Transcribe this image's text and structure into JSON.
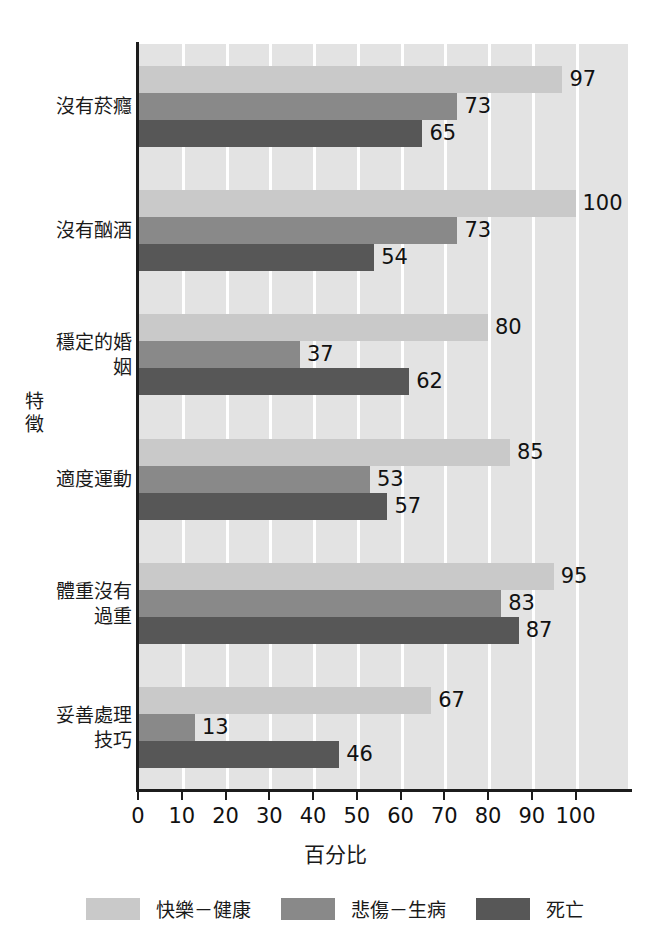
{
  "chart_data": {
    "type": "bar",
    "orientation": "horizontal",
    "title": "",
    "xlabel": "百分比",
    "ylabel": "特徵",
    "xlim": [
      0,
      112
    ],
    "xticks": [
      0,
      10,
      20,
      30,
      40,
      50,
      60,
      70,
      80,
      90,
      100
    ],
    "xtick_labels": [
      "0",
      "10",
      "20",
      "30",
      "40",
      "50",
      "60",
      "70",
      "80",
      "90",
      "100"
    ],
    "grid": "vertical-white-gridlines",
    "legend_position": "bottom-center",
    "categories": [
      "沒有菸癮",
      "沒有酗酒",
      "穩定的婚姻",
      "適度運動",
      "體重沒有過重",
      "妥善處理技巧"
    ],
    "series": [
      {
        "name": "快樂－健康",
        "color": "#c9c9c9",
        "values": [
          97,
          100,
          80,
          85,
          95,
          67
        ],
        "labels": [
          "97",
          "100",
          "80",
          "85",
          "95",
          "67"
        ]
      },
      {
        "name": "悲傷－生病",
        "color": "#898989",
        "values": [
          73,
          73,
          37,
          53,
          83,
          13
        ],
        "labels": [
          "73",
          "73",
          "37",
          "53",
          "83",
          "13"
        ]
      },
      {
        "name": "死亡",
        "color": "#575757",
        "values": [
          65,
          54,
          62,
          57,
          87,
          46
        ],
        "labels": [
          "65",
          "54",
          "62",
          "57",
          "87",
          "46"
        ]
      }
    ]
  },
  "plot_style": {
    "plot_background": "#e3e3e3",
    "gridline_color": "#ffffff",
    "axis_color": "#1c1c1c",
    "page_background": "#ffffff"
  }
}
